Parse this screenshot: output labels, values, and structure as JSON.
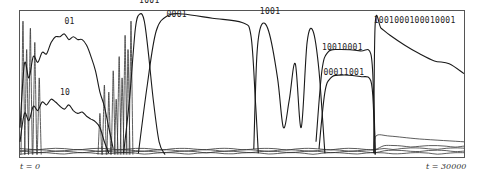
{
  "chart_data": {
    "type": "line",
    "title": "",
    "xlabel": "",
    "ylabel": "",
    "x_start_label": "t = 0",
    "x_end_label": "t = 30000",
    "xlim": [
      0,
      30000
    ],
    "ylim": [
      0,
      1
    ],
    "grid": false,
    "legend": "inline labels",
    "annotations": [
      {
        "text": "01",
        "x": 3000,
        "y": 0.93
      },
      {
        "text": "10",
        "x": 2700,
        "y": 0.43
      },
      {
        "text": "1001",
        "x": 8050,
        "y": 1.08
      },
      {
        "text": "0001",
        "x": 9900,
        "y": 0.98
      },
      {
        "text": "1001",
        "x": 16200,
        "y": 1.0
      },
      {
        "text": "10010001",
        "x": 20400,
        "y": 0.75
      },
      {
        "text": "00011001",
        "x": 20500,
        "y": 0.57
      },
      {
        "text": "1001000100010001",
        "x": 23900,
        "y": 0.94
      }
    ],
    "series": [
      {
        "name": "01",
        "x": [
          0,
          300,
          600,
          900,
          1200,
          1500,
          1800,
          2100,
          2400,
          2700,
          3000,
          3300,
          3600,
          3900,
          4200,
          4500,
          4800,
          5100,
          5400,
          5700,
          6000,
          6300
        ],
        "values": [
          0.2,
          0.65,
          0.55,
          0.7,
          0.66,
          0.73,
          0.72,
          0.8,
          0.84,
          0.84,
          0.86,
          0.82,
          0.84,
          0.82,
          0.82,
          0.78,
          0.7,
          0.6,
          0.45,
          0.35,
          0.2,
          0.05
        ]
      },
      {
        "name": "10",
        "x": [
          0,
          300,
          600,
          900,
          1200,
          1500,
          1800,
          2100,
          2400,
          2700,
          3000,
          3300,
          3600,
          3900,
          4200,
          4500,
          4800,
          5100,
          5400,
          5700,
          6000
        ],
        "values": [
          0.1,
          0.3,
          0.25,
          0.35,
          0.32,
          0.38,
          0.36,
          0.4,
          0.38,
          0.35,
          0.33,
          0.36,
          0.32,
          0.3,
          0.31,
          0.28,
          0.26,
          0.24,
          0.2,
          0.1,
          0.02
        ]
      },
      {
        "name": "1001",
        "x": [
          7000,
          7400,
          7800,
          8100,
          8400,
          8700,
          9000,
          9400,
          9800
        ],
        "values": [
          0.02,
          0.4,
          0.9,
          1.0,
          0.95,
          0.7,
          0.4,
          0.1,
          0.01
        ]
      },
      {
        "name": "0001",
        "x": [
          8000,
          8600,
          9200,
          10000,
          11000,
          13000,
          15000,
          15600,
          15900,
          16100
        ],
        "values": [
          0.02,
          0.5,
          0.88,
          0.99,
          1.0,
          0.97,
          0.94,
          0.85,
          0.4,
          0.02
        ]
      },
      {
        "name": "1001 (second)",
        "x": [
          15800,
          16000,
          16300,
          16800,
          17400,
          17800,
          18200,
          18600,
          19000,
          19400,
          19800,
          20200,
          20600
        ],
        "values": [
          0.05,
          0.7,
          0.92,
          0.88,
          0.55,
          0.2,
          0.4,
          0.65,
          0.2,
          0.8,
          0.88,
          0.6,
          0.02
        ]
      },
      {
        "name": "10010001",
        "x": [
          20000,
          20400,
          20800,
          21500,
          23000,
          23700,
          23900,
          24000
        ],
        "values": [
          0.1,
          0.6,
          0.73,
          0.75,
          0.74,
          0.72,
          0.4,
          0.01
        ]
      },
      {
        "name": "00011001",
        "x": [
          20200,
          20600,
          21000,
          21600,
          23000,
          23700,
          23900,
          24000
        ],
        "values": [
          0.05,
          0.45,
          0.55,
          0.57,
          0.56,
          0.53,
          0.3,
          0.01
        ]
      },
      {
        "name": "1001000100010001",
        "x": [
          23900,
          24000,
          24400,
          25000,
          26000,
          27000,
          28000,
          29000,
          30000
        ],
        "values": [
          0.02,
          0.93,
          0.9,
          0.85,
          0.78,
          0.72,
          0.67,
          0.65,
          0.58
        ]
      }
    ]
  }
}
